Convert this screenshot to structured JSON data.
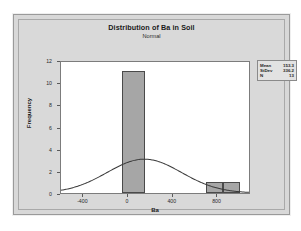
{
  "chart_data": {
    "type": "bar",
    "title": "Distribution of Ba in Soil",
    "subtitle": "Normal",
    "xlabel": "Ba",
    "ylabel": "Frequency",
    "xlim": [
      -600,
      1100
    ],
    "ylim": [
      0,
      12
    ],
    "xticks": [
      -400,
      0,
      400,
      800
    ],
    "yticks": [
      0,
      2,
      4,
      6,
      8,
      10,
      12
    ],
    "grid": false,
    "bars": [
      {
        "x_start": -50,
        "x_end": 150,
        "height": 11
      },
      {
        "x_start": 700,
        "x_end": 850,
        "height": 1
      },
      {
        "x_start": 850,
        "x_end": 1000,
        "height": 1
      }
    ],
    "curve": {
      "name": "Normal fit",
      "mean": 153.3,
      "stdev": 336.2,
      "n": 13,
      "peak_height": 3.1
    },
    "legend_position": "outside-top-right"
  },
  "stats": {
    "rows": [
      {
        "key": "Mean",
        "value": "153.3"
      },
      {
        "key": "StDev",
        "value": "336.2"
      },
      {
        "key": "N",
        "value": "13"
      }
    ]
  },
  "axis": {
    "y_tick_labels": [
      "0",
      "2",
      "4",
      "6",
      "8",
      "10",
      "12"
    ],
    "x_tick_labels": [
      "-400",
      "0",
      "400",
      "800"
    ]
  }
}
